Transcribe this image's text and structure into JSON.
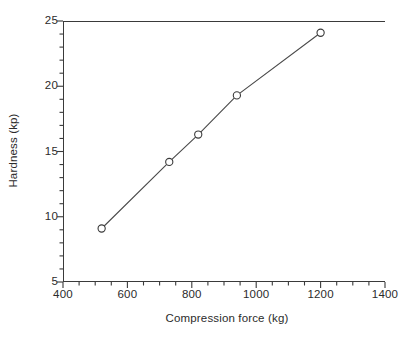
{
  "chart_data": {
    "type": "line",
    "title": "",
    "subtitle": "",
    "xlabel": "Compression force (kg)",
    "ylabel": "Hardness (kp)",
    "xlim": [
      400,
      1400
    ],
    "ylim": [
      5,
      25
    ],
    "x_major_ticks": [
      400,
      600,
      800,
      1000,
      1200,
      1400
    ],
    "y_major_ticks": [
      5,
      10,
      15,
      20,
      25
    ],
    "x_minor_tick_step": 50,
    "y_minor_tick_step": 1,
    "x_tick_labels": [
      "400",
      "600",
      "800",
      "1000",
      "1200",
      "1400"
    ],
    "y_tick_labels": [
      "5",
      "10",
      "15",
      "20",
      "25"
    ],
    "grid": false,
    "legend": null,
    "legend_position": "none",
    "tick_direction": "out",
    "frame": "left-bottom-top",
    "marker": "open-circle",
    "line_color": "#4a4a4a",
    "marker_edge_color": "#3a3a3a",
    "marker_face_color": "#ffffff",
    "axis_color": "#3a3a3a",
    "background_color": "#ffffff",
    "series": [
      {
        "name": "Hardness vs compression force",
        "x": [
          520,
          730,
          820,
          940,
          1200
        ],
        "y": [
          9.1,
          14.2,
          16.3,
          19.3,
          24.1
        ]
      }
    ],
    "points": [
      {
        "x": 520,
        "y": 9.1
      },
      {
        "x": 730,
        "y": 14.2
      },
      {
        "x": 820,
        "y": 16.3
      },
      {
        "x": 940,
        "y": 19.3
      },
      {
        "x": 1200,
        "y": 24.1
      }
    ]
  }
}
